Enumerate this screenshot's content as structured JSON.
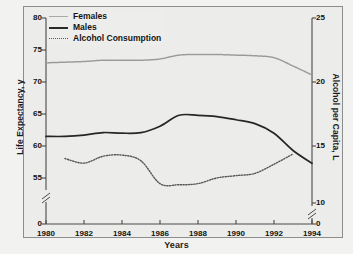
{
  "chart_data": {
    "type": "line",
    "title": "",
    "xlabel": "Years",
    "ylabel": "Life Expectancy, y",
    "ylabel_right": "Alcohol per Capita, L",
    "grid": false,
    "legend_position": "top-left",
    "xlim": [
      1980,
      1994
    ],
    "xticks": [
      1980,
      1982,
      1984,
      1986,
      1988,
      1990,
      1992,
      1994
    ],
    "ylim_left": [
      55,
      80
    ],
    "yticks_left": [
      0,
      55,
      60,
      65,
      70,
      75,
      80
    ],
    "y_axis_break_left": true,
    "ylim_right": [
      10,
      25
    ],
    "yticks_right": [
      0,
      10,
      15,
      20,
      25
    ],
    "y_axis_break_right": true,
    "x": [
      1980,
      1981,
      1982,
      1983,
      1984,
      1985,
      1986,
      1987,
      1988,
      1989,
      1990,
      1991,
      1992,
      1993,
      1994
    ],
    "series": [
      {
        "name": "Females",
        "axis": "left",
        "style": "thin-line",
        "color": "#9a9a9a",
        "values": [
          73.0,
          73.1,
          73.2,
          73.4,
          73.4,
          73.4,
          73.6,
          74.2,
          74.3,
          74.3,
          74.2,
          74.1,
          73.8,
          72.5,
          71.1
        ]
      },
      {
        "name": "Males",
        "axis": "left",
        "style": "solid-bold",
        "color": "#262626",
        "values": [
          61.5,
          61.5,
          61.7,
          62.1,
          62.0,
          62.1,
          63.1,
          64.8,
          64.8,
          64.6,
          64.1,
          63.5,
          62.0,
          59.3,
          57.3
        ]
      },
      {
        "name": "Alcohol Consumption",
        "axis": "right",
        "style": "dotted",
        "color": "#565656",
        "values": [
          null,
          13.9,
          13.5,
          14.1,
          14.2,
          13.7,
          11.7,
          11.6,
          11.7,
          12.2,
          12.4,
          12.6,
          13.4,
          14.3,
          null
        ]
      }
    ]
  },
  "legend": {
    "items": [
      {
        "label": "Females"
      },
      {
        "label": "Males"
      },
      {
        "label": "Alcohol Consumption"
      }
    ]
  },
  "axes": {
    "left_label": "Life Expectancy, y",
    "right_label": "Alcohol per Capita, L",
    "x_label": "Years",
    "left_ticks": [
      "80",
      "75",
      "70",
      "65",
      "60",
      "55",
      "0"
    ],
    "right_ticks": [
      "25",
      "20",
      "15",
      "10",
      "0"
    ],
    "x_ticks": [
      "1980",
      "1982",
      "1984",
      "1986",
      "1988",
      "1990",
      "1992",
      "1994"
    ]
  }
}
